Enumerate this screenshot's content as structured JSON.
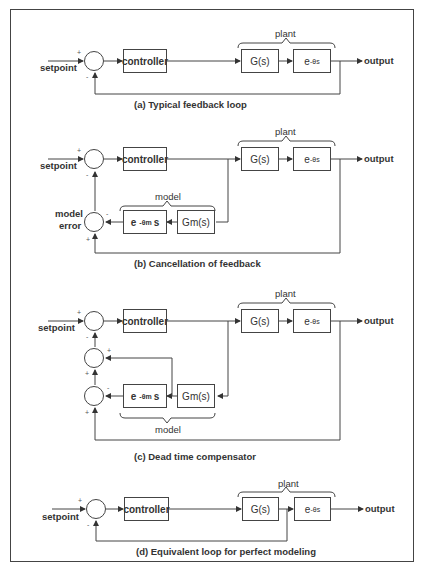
{
  "diagram": {
    "type": "block-diagram",
    "panels": [
      {
        "id": "a",
        "caption": "(a) Typical feedback loop",
        "input_label": "setpoint",
        "output_label": "output",
        "controller_label": "controller",
        "plant_label": "plant",
        "plant_blocks": [
          "G(s)",
          "e-θs"
        ],
        "sum_signs": [
          "+",
          "-"
        ]
      },
      {
        "id": "b",
        "caption": "(b) Cancellation of feedback",
        "input_label": "setpoint",
        "output_label": "output",
        "controller_label": "controller",
        "plant_label": "plant",
        "plant_blocks": [
          "G(s)",
          "e-θs"
        ],
        "model_label": "model",
        "model_blocks": [
          "e-θm s",
          "Gm(s)"
        ],
        "model_error_label": "model error",
        "sum_signs": [
          "+",
          "-",
          "-",
          "+"
        ]
      },
      {
        "id": "c",
        "caption": "(c) Dead time compensator",
        "input_label": "setpoint",
        "output_label": "output",
        "controller_label": "controller",
        "plant_label": "plant",
        "plant_blocks": [
          "G(s)",
          "e-θs"
        ],
        "model_label": "model",
        "model_blocks": [
          "e-θm s",
          "Gm(s)"
        ],
        "sum_signs": [
          "+",
          "-",
          "+",
          "+",
          "-",
          "+"
        ]
      },
      {
        "id": "d",
        "caption": "(d) Equivalent loop for perfect modeling",
        "input_label": "setpoint",
        "output_label": "output",
        "controller_label": "controller",
        "plant_label": "plant",
        "plant_blocks": [
          "G(s)",
          "e-θs"
        ],
        "sum_signs": [
          "+",
          "-"
        ]
      }
    ]
  },
  "text": {
    "setpoint": "setpoint",
    "output": "output",
    "controller": "controller",
    "plant": "plant",
    "model": "model",
    "model_error_1": "model",
    "model_error_2": "error",
    "g": "G(s)",
    "gm": "Gm(s)",
    "delay_base": "e",
    "delay_exp": "-θs",
    "model_delay_base": "e",
    "model_delay_exp": "-θm",
    "model_delay_s": "s",
    "plus": "+",
    "minus": "-",
    "cap_a": "(a) Typical feedback loop",
    "cap_b": "(b) Cancellation of feedback",
    "cap_c": "(c) Dead time compensator",
    "cap_d": "(d) Equivalent loop for perfect modeling"
  }
}
